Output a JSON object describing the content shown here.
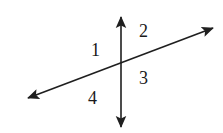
{
  "figure": {
    "background_color": "#ffffff",
    "stroke_color": "#1f1f1f",
    "stroke_width": 1.6,
    "width": 223,
    "height": 133,
    "intersection": {
      "x": 121,
      "y": 64
    }
  },
  "lines": [
    {
      "name": "vertical-line",
      "x1": 121,
      "y1": 17,
      "x2": 121,
      "y2": 127,
      "arrow_start": true,
      "arrow_end": true
    },
    {
      "name": "diagonal-line",
      "x1": 28,
      "y1": 98,
      "x2": 213,
      "y2": 28,
      "arrow_start": true,
      "arrow_end": true
    }
  ],
  "labels": [
    {
      "id": "angle-1",
      "text": "1",
      "x": 97,
      "y": 49
    },
    {
      "id": "angle-2",
      "text": "2",
      "x": 146,
      "y": 30
    },
    {
      "id": "angle-3",
      "text": "3",
      "x": 146,
      "y": 77
    },
    {
      "id": "angle-4",
      "text": "4",
      "x": 94,
      "y": 97
    }
  ]
}
